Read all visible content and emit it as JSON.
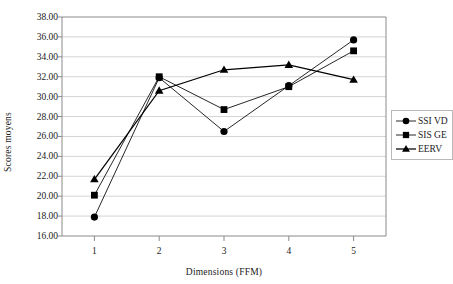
{
  "chart_data": {
    "type": "line",
    "title": "",
    "xlabel": "Dimensions (FFM)",
    "ylabel": "Scores moyens",
    "x": [
      1,
      2,
      3,
      4,
      5
    ],
    "categories": [
      "1",
      "2",
      "3",
      "4",
      "5"
    ],
    "xlim": [
      0.5,
      5.5
    ],
    "ylim": [
      16.0,
      38.0
    ],
    "ytick_step": 2.0,
    "yticks": [
      16.0,
      18.0,
      20.0,
      22.0,
      24.0,
      26.0,
      28.0,
      30.0,
      32.0,
      34.0,
      36.0,
      38.0
    ],
    "ytick_labels": [
      "16.00",
      "18.00",
      "20.00",
      "22.00",
      "24.00",
      "26.00",
      "28.00",
      "30.00",
      "32.00",
      "34.00",
      "36.00",
      "38.00"
    ],
    "xtick_labels": [
      "1",
      "2",
      "3",
      "4",
      "5"
    ],
    "grid": "horizontal",
    "legend_position": "right",
    "series": [
      {
        "name": "SSI VD",
        "marker": "circle",
        "color": "#000000",
        "values": [
          17.9,
          31.9,
          26.5,
          31.1,
          35.7
        ]
      },
      {
        "name": "SIS GE",
        "marker": "square",
        "color": "#000000",
        "values": [
          20.1,
          32.0,
          28.7,
          31.0,
          34.6
        ]
      },
      {
        "name": "EERV",
        "marker": "triangle",
        "color": "#000000",
        "values": [
          21.7,
          30.6,
          32.7,
          33.2,
          31.7
        ]
      }
    ]
  },
  "legend": {
    "entries": [
      {
        "label": "SSI VD",
        "marker": "circle-marker-icon"
      },
      {
        "label": "SIS GE",
        "marker": "square-marker-icon"
      },
      {
        "label": "EERV",
        "marker": "triangle-marker-icon"
      }
    ]
  },
  "axes": {
    "y_title": "Scores moyens",
    "x_title": "Dimensions (FFM)"
  }
}
